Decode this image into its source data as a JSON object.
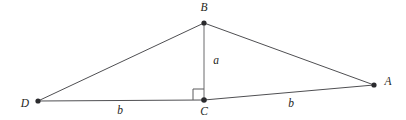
{
  "figure": {
    "type": "geometry-diagram",
    "width": 406,
    "height": 120,
    "background_color": "#ffffff",
    "line_color": "#4f4f52",
    "label_color": "#1f1f22",
    "vertex_dot_color": "#2b2b2e",
    "vertices": [
      {
        "id": "B",
        "label": "B",
        "x": 204,
        "y": 23,
        "label_x": 204,
        "label_y": 8,
        "dot_r": 2.6
      },
      {
        "id": "A",
        "label": "A",
        "x": 374,
        "y": 85,
        "label_x": 388,
        "label_y": 82,
        "dot_r": 2.6
      },
      {
        "id": "C",
        "label": "C",
        "x": 204,
        "y": 100,
        "label_x": 204,
        "label_y": 112,
        "dot_r": 2.8
      },
      {
        "id": "D",
        "label": "D",
        "x": 38,
        "y": 101,
        "label_x": 25,
        "label_y": 104,
        "dot_r": 2.6
      }
    ],
    "edges": [
      {
        "id": "DB",
        "from": "D",
        "to": "B",
        "x1": 38,
        "y1": 101,
        "x2": 204,
        "y2": 23
      },
      {
        "id": "BA",
        "from": "B",
        "to": "A",
        "x1": 204,
        "y1": 23,
        "x2": 374,
        "y2": 85
      },
      {
        "id": "DC",
        "from": "D",
        "to": "C",
        "x1": 38,
        "y1": 101,
        "x2": 204,
        "y2": 100
      },
      {
        "id": "CA",
        "from": "C",
        "to": "A",
        "x1": 204,
        "y1": 100,
        "x2": 374,
        "y2": 85
      }
    ],
    "altitude": {
      "id": "BC",
      "from": "B",
      "to": "C",
      "x1": 204,
      "y1": 23,
      "x2": 204,
      "y2": 100
    },
    "right_angle": {
      "at": "C",
      "size": 11,
      "path": "M 193 100 L 193 89 L 204 89"
    },
    "side_labels": [
      {
        "id": "a",
        "text": "a",
        "x": 216,
        "y": 61,
        "describes": "BC"
      },
      {
        "id": "b-left",
        "text": "b",
        "x": 120,
        "y": 111,
        "describes": "DC"
      },
      {
        "id": "b-right",
        "text": "b",
        "x": 291,
        "y": 104,
        "describes": "CA"
      }
    ]
  }
}
